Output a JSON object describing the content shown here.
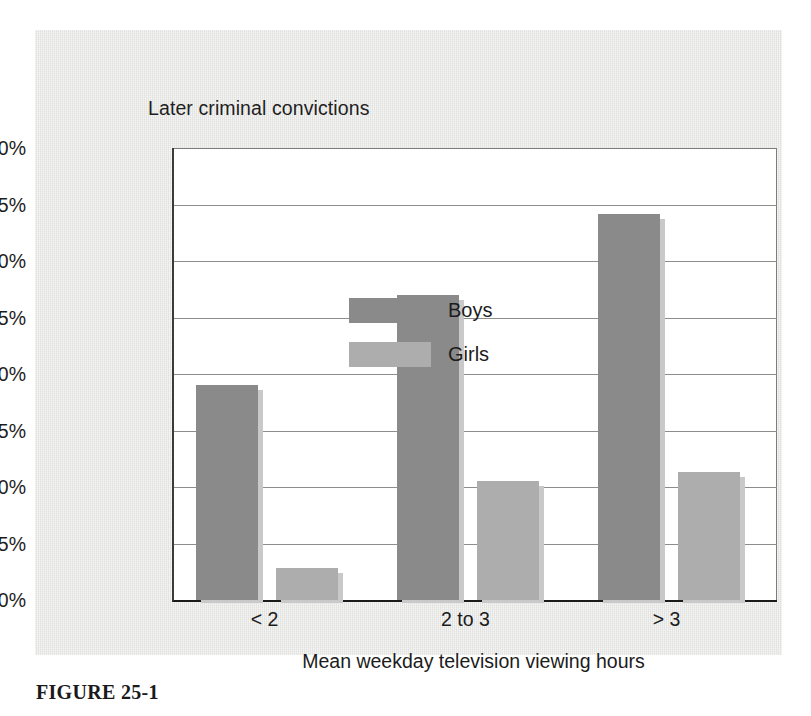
{
  "figure": {
    "caption": "FIGURE 25-1"
  },
  "chart_data": {
    "type": "bar",
    "title": "Later criminal convictions",
    "xlabel": "Mean weekday television viewing hours",
    "ylabel": "Later criminal convictions",
    "categories": [
      "< 2",
      "2 to 3",
      "> 3"
    ],
    "series": [
      {
        "name": "Boys",
        "color": "#8a8a8a",
        "values": [
          19.0,
          27.0,
          34.2
        ]
      },
      {
        "name": "Girls",
        "color": "#adadad",
        "values": [
          2.8,
          10.5,
          11.3
        ]
      }
    ],
    "ylim": [
      0,
      40
    ],
    "ytick_values": [
      0,
      5,
      10,
      15,
      20,
      25,
      30,
      35,
      40
    ],
    "ytick_labels": [
      "0%",
      "5%",
      "10%",
      "15%",
      "20%",
      "25%",
      "30%",
      "35%",
      "40%"
    ],
    "grid": true,
    "legend_position": "top-left-inside",
    "value_suffix": "%"
  },
  "colors": {
    "panel_background": "#e8e8e6",
    "plot_background": "#ffffff",
    "gridline": "#8d8d8d",
    "axis": "#1a1a1a",
    "text": "#1c1c1c"
  }
}
